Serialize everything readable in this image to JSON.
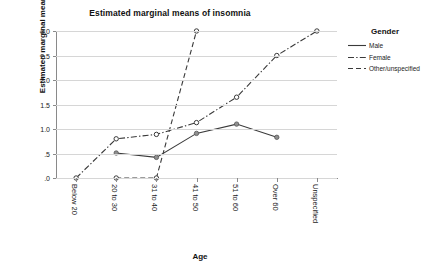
{
  "chart_data": {
    "type": "line",
    "title": "Estimated marginal means of insomnia",
    "xlabel": "Age",
    "ylabel": "Estimated marginal means",
    "categories": [
      "Below 20",
      "20 to 30",
      "31 to 40",
      "41 to 50",
      "51 to 60",
      "Over 60",
      "Unspecified"
    ],
    "ylim": [
      0,
      3.0
    ],
    "yticks": [
      ".0",
      ".5",
      "1.0",
      "1.5",
      "2.0",
      "2.5",
      "3.0"
    ],
    "ytick_values": [
      0,
      0.5,
      1.0,
      1.5,
      2.0,
      2.5,
      3.0
    ],
    "grid": "horizontal",
    "legend_position": "right",
    "legend_title": "Gender",
    "series": [
      {
        "name": "Male",
        "style": "solid",
        "values": [
          null,
          0.51,
          0.42,
          0.91,
          1.1,
          0.83,
          null
        ]
      },
      {
        "name": "Female",
        "style": "dash-dot",
        "values": [
          0.0,
          0.8,
          0.89,
          1.13,
          1.65,
          2.5,
          3.0
        ]
      },
      {
        "name": "Other/unspecified",
        "style": "dashed",
        "values": [
          null,
          0.0,
          0.0,
          3.0,
          null,
          null,
          null
        ]
      }
    ]
  },
  "legend": {
    "title": "Gender",
    "items": [
      {
        "label": "Male"
      },
      {
        "label": "Female"
      },
      {
        "label": "Other/unspecified"
      }
    ]
  },
  "colors": {
    "line": "#3a3a3a",
    "grid": "#d6d6d6",
    "axis": "#8a8a8a",
    "text": "#1a1a1a",
    "background": "#ffffff"
  }
}
